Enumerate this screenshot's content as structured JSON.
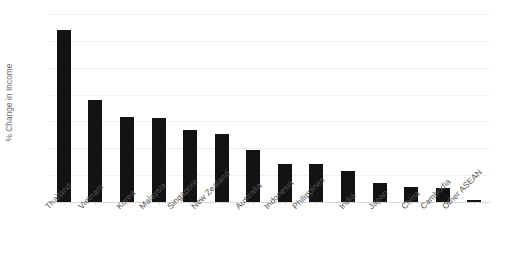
{
  "chart_data": {
    "type": "bar",
    "title": "",
    "subtitle": "",
    "xlabel": "",
    "ylabel": "% Change in Income",
    "ylim": [
      0,
      14
    ],
    "y_ticks": [
      0,
      2,
      4,
      6,
      8,
      10,
      12,
      14
    ],
    "y_tick_labels": [
      "0",
      "2",
      "4",
      "6",
      "8",
      "10",
      "12",
      "14"
    ],
    "grid": true,
    "legend": false,
    "legend_position": "none",
    "bar_color": "#131313",
    "gridline_color": "#f0f0f0",
    "axis_color": "#d9d9d9",
    "tick_label_color": "#595959",
    "axis_title_color": "#666666",
    "categories": [
      "Thailand",
      "Vietnam",
      "Korea",
      "Malaysia",
      "Singapore",
      "New Zealand",
      "Australia",
      "Indonesia",
      "Philippines",
      "India",
      "Japan",
      "China",
      "Cambodia",
      "Other ASEAN"
    ],
    "values": [
      12.8,
      7.6,
      6.35,
      6.25,
      5.35,
      5.1,
      3.85,
      2.8,
      2.8,
      2.3,
      1.45,
      1.15,
      1.05,
      0.15
    ]
  }
}
